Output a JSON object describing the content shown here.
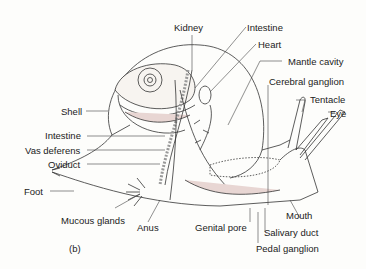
{
  "figure": {
    "panel_label": "(b)",
    "colors": {
      "line": "#333333",
      "organ_fill": "#e8d6d3",
      "background": "#fdfdfb"
    }
  },
  "labels": {
    "kidney": "Kidney",
    "intestine_top": "Intestine",
    "heart": "Heart",
    "mantle_cavity": "Mantle cavity",
    "cerebral_ganglion": "Cerebral ganglion",
    "tentacle": "Tentacle",
    "eye": "Eye",
    "shell": "Shell",
    "intestine_left": "Intestine",
    "vas_deferens": "Vas deferens",
    "oviduct": "Oviduct",
    "foot": "Foot",
    "mucous_glands": "Mucous glands",
    "anus": "Anus",
    "genital_pore": "Genital pore",
    "mouth": "Mouth",
    "salivary_duct": "Salivary duct",
    "pedal_ganglion": "Pedal ganglion"
  }
}
